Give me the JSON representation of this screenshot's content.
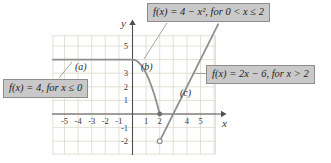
{
  "labels": {
    "box_top": "f(x) = 4 − x², for 0 < x ≤ 2",
    "box_left": "f(x) = 4, for x ≤ 0",
    "box_right": "f(x) = 2x − 6, for x > 2",
    "curve_a": "(a)",
    "curve_b": "(b)",
    "curve_c": "(c)"
  },
  "colors": {
    "grid": "#ddd8ca",
    "axis": "#4f4f4f",
    "curve": "#8f8f8f",
    "curve_dark": "#6f6f6f",
    "leader": "#9a9a9a",
    "box_bg": "#c9c9c9",
    "box_border": "#8d8d8d"
  },
  "chart_data": {
    "type": "line",
    "title": "",
    "xlabel": "x",
    "ylabel": "y",
    "grid": true,
    "xlim": [
      -5.85,
      6.3
    ],
    "ylim": [
      -2.95,
      6.6
    ],
    "x_ticks": [
      -5,
      -4,
      -3,
      -2,
      -1,
      1,
      2,
      4,
      5
    ],
    "y_ticks": [
      5,
      3,
      2,
      1,
      -1,
      -2
    ],
    "series": [
      {
        "name": "f(x) = 4, for x ≤ 0",
        "curve_label": "(a)",
        "points": [
          [
            -5.85,
            4
          ],
          [
            0,
            4
          ]
        ]
      },
      {
        "name": "f(x) = 4 − x², for 0 < x ≤ 2",
        "curve_label": "(b)",
        "points": [
          [
            0,
            4
          ],
          [
            0.2,
            3.96
          ],
          [
            0.4,
            3.84
          ],
          [
            0.6,
            3.64
          ],
          [
            0.8,
            3.36
          ],
          [
            1,
            3
          ],
          [
            1.2,
            2.56
          ],
          [
            1.4,
            2.04
          ],
          [
            1.6,
            1.44
          ],
          [
            1.8,
            0.76
          ],
          [
            2,
            0
          ]
        ]
      },
      {
        "name": "f(x) = 2x − 6, for x > 2",
        "curve_label": "(c)",
        "points": [
          [
            2,
            -2
          ],
          [
            6.3,
            6.6
          ]
        ]
      }
    ],
    "markers": [
      {
        "x": 2,
        "y": 0,
        "style": "closed"
      },
      {
        "x": 2,
        "y": -2,
        "style": "open"
      }
    ]
  }
}
